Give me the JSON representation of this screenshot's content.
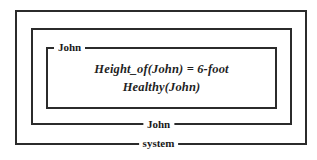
{
  "diagram": {
    "type": "nested-context-boxes",
    "colors": {
      "background": "#ffffff",
      "border": "#2b2b2b",
      "label_text": "#1a1a1a",
      "formula_text": "#1f1f1f"
    },
    "boxes": [
      {
        "id": "system",
        "level": 0,
        "label": "system",
        "label_position": "bottom-center"
      },
      {
        "id": "john-middle",
        "level": 1,
        "label": "John",
        "label_position": "bottom-center"
      },
      {
        "id": "john-inner",
        "level": 2,
        "label": "John",
        "label_position": "top-left"
      }
    ],
    "content": {
      "lines": [
        "Height_of(John) = 6-foot",
        "Healthy(John)"
      ]
    }
  }
}
